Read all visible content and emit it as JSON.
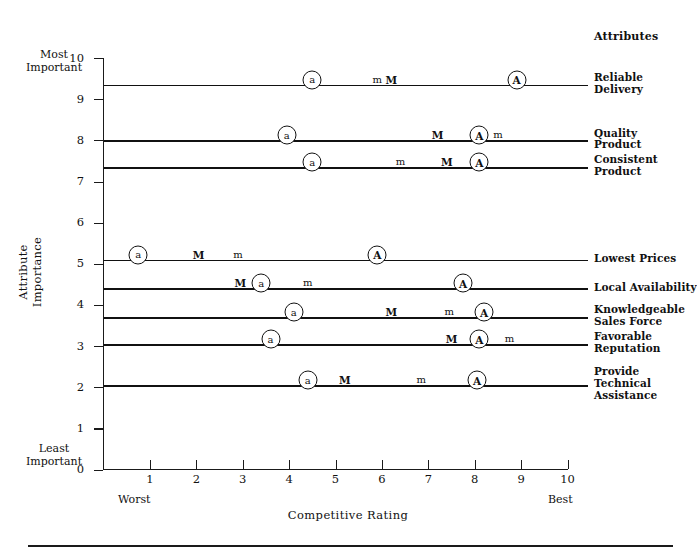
{
  "chart_data": {
    "type": "scatter",
    "title": "",
    "xlabel": "Competitive Rating",
    "ylabel": "Attribute Importance",
    "xlim": [
      0,
      10
    ],
    "ylim": [
      0,
      10
    ],
    "grid": false,
    "x_ticks": [
      "1",
      "2",
      "3",
      "4",
      "5",
      "6",
      "7",
      "8",
      "9",
      "10"
    ],
    "y_ticks": [
      "0",
      "1",
      "2",
      "3",
      "4",
      "5",
      "6",
      "7",
      "8",
      "9",
      "10"
    ],
    "x_axis_low_label": "Worst",
    "x_axis_high_label": "Best",
    "y_axis_high_label": "Most\nImportant",
    "y_axis_low_label": "Least\nImportant",
    "attributes_header": "Attributes",
    "marker_legend": [
      "a",
      "m",
      "M",
      "A"
    ],
    "rows": [
      {
        "label": "Reliable\nDelivery",
        "importance": 9.35,
        "markers": [
          {
            "symbol": "a",
            "circled": true,
            "rating": 4.5
          },
          {
            "symbol": "m",
            "circled": false,
            "rating": 5.9
          },
          {
            "symbol": "M",
            "circled": false,
            "rating": 6.2
          },
          {
            "symbol": "A",
            "circled": true,
            "rating": 8.9
          }
        ]
      },
      {
        "label": "Quality\nProduct",
        "importance": 8.0,
        "markers": [
          {
            "symbol": "a",
            "circled": true,
            "rating": 3.95
          },
          {
            "symbol": "M",
            "circled": false,
            "rating": 7.2
          },
          {
            "symbol": "A",
            "circled": true,
            "rating": 8.1
          },
          {
            "symbol": "m",
            "circled": false,
            "rating": 8.5
          }
        ]
      },
      {
        "label": "Consistent\nProduct",
        "importance": 7.35,
        "markers": [
          {
            "symbol": "a",
            "circled": true,
            "rating": 4.5
          },
          {
            "symbol": "m",
            "circled": false,
            "rating": 6.4
          },
          {
            "symbol": "M",
            "circled": false,
            "rating": 7.4
          },
          {
            "symbol": "A",
            "circled": true,
            "rating": 8.1
          }
        ]
      },
      {
        "label": "Lowest Prices",
        "importance": 5.1,
        "markers": [
          {
            "symbol": "a",
            "circled": true,
            "rating": 0.75
          },
          {
            "symbol": "M",
            "circled": false,
            "rating": 2.05
          },
          {
            "symbol": "m",
            "circled": false,
            "rating": 2.9
          },
          {
            "symbol": "A",
            "circled": true,
            "rating": 5.9
          }
        ]
      },
      {
        "label": "Local Availability",
        "importance": 4.4,
        "markers": [
          {
            "symbol": "M",
            "circled": false,
            "rating": 2.95
          },
          {
            "symbol": "a",
            "circled": true,
            "rating": 3.4
          },
          {
            "symbol": "m",
            "circled": false,
            "rating": 4.4
          },
          {
            "symbol": "A",
            "circled": true,
            "rating": 7.75
          }
        ]
      },
      {
        "label": "Knowledgeable\nSales Force",
        "importance": 3.7,
        "markers": [
          {
            "symbol": "a",
            "circled": true,
            "rating": 4.1
          },
          {
            "symbol": "M",
            "circled": false,
            "rating": 6.2
          },
          {
            "symbol": "m",
            "circled": false,
            "rating": 7.45
          },
          {
            "symbol": "A",
            "circled": true,
            "rating": 8.2
          }
        ]
      },
      {
        "label": "Favorable\nReputation",
        "importance": 3.05,
        "markers": [
          {
            "symbol": "a",
            "circled": true,
            "rating": 3.6
          },
          {
            "symbol": "M",
            "circled": false,
            "rating": 7.5
          },
          {
            "symbol": "A",
            "circled": true,
            "rating": 8.1
          },
          {
            "symbol": "m",
            "circled": false,
            "rating": 8.75
          }
        ]
      },
      {
        "label": "Provide\nTechnical\nAssistance",
        "importance": 2.05,
        "markers": [
          {
            "symbol": "a",
            "circled": true,
            "rating": 4.4
          },
          {
            "symbol": "M",
            "circled": false,
            "rating": 5.2
          },
          {
            "symbol": "m",
            "circled": false,
            "rating": 6.85
          },
          {
            "symbol": "A",
            "circled": true,
            "rating": 8.05
          }
        ]
      }
    ]
  }
}
